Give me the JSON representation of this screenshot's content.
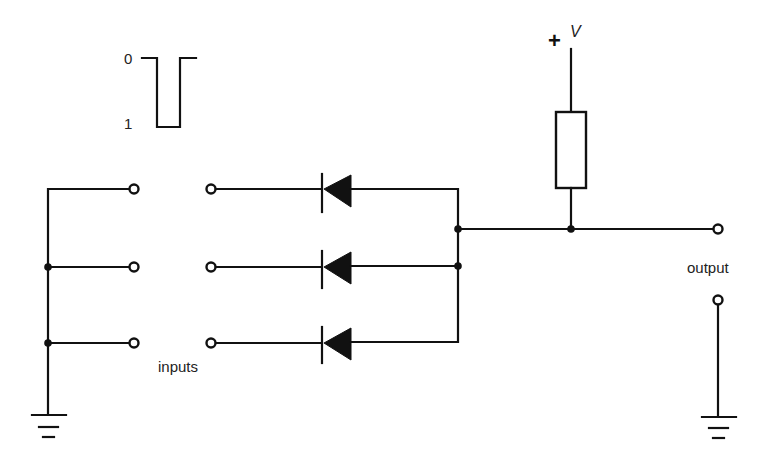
{
  "diagram": {
    "type": "circuit-schematic",
    "pulse": {
      "label_high": "0",
      "label_low": "1"
    },
    "supply": {
      "sign": "+",
      "label": "V"
    },
    "labels": {
      "inputs": "inputs",
      "output": "output"
    },
    "components": {
      "diodes": 3,
      "resistors": 1,
      "input_switches": 3,
      "grounds": 2
    },
    "colors": {
      "line": "#111111",
      "background": "#ffffff"
    }
  }
}
